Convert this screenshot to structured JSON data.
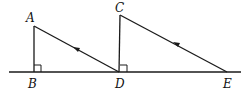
{
  "diagram": {
    "type": "geometry",
    "colors": {
      "stroke": "#1a1a1a",
      "background": "#ffffff"
    },
    "points": {
      "A": {
        "label": "A",
        "x": 34,
        "y": 26
      },
      "B": {
        "label": "B",
        "x": 34,
        "y": 72
      },
      "C": {
        "label": "C",
        "x": 120,
        "y": 15
      },
      "D": {
        "label": "D",
        "x": 119,
        "y": 72
      },
      "E": {
        "label": "E",
        "x": 227,
        "y": 72
      }
    },
    "labels": {
      "A": "A",
      "B": "B",
      "C": "C",
      "D": "D",
      "E": "E"
    },
    "segments": [
      {
        "from": "A",
        "to": "B"
      },
      {
        "from": "A",
        "to": "D",
        "arrow": "toward A"
      },
      {
        "from": "C",
        "to": "D"
      },
      {
        "from": "C",
        "to": "E",
        "arrow": "toward C"
      }
    ],
    "baseline": {
      "x1": 9,
      "x2": 241,
      "y": 72
    },
    "right_angles": [
      "B",
      "D"
    ]
  }
}
